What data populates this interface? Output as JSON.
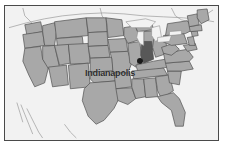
{
  "map": {
    "title": "United States map with Indiana highlighted",
    "region": "United States",
    "highlighted_state": "Indiana",
    "city_label": "Indianapolis",
    "marker_icon": "city-dot-icon",
    "colors": {
      "background": "#f2f2f2",
      "frame_border": "#4a4a4a",
      "state_fill": "#a8a8a8",
      "state_outline": "#4f4f4f",
      "highlight_fill": "#585858",
      "water_fill": "#f2f2f2",
      "neighbor_outline": "#8c8c8c",
      "marker": "#1a1a1a",
      "label_text": "#2e2e2e"
    }
  }
}
